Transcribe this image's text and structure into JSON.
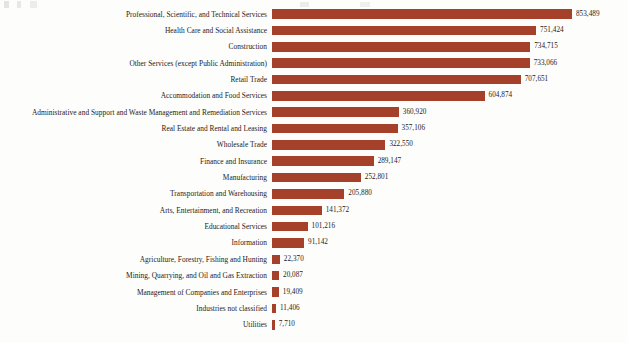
{
  "chart_data": {
    "type": "bar",
    "orientation": "horizontal",
    "title": "",
    "subtitle": "",
    "xlabel": "",
    "ylabel": "",
    "grid": false,
    "legend": null,
    "axis_visible": false,
    "xlim": [
      0,
      853489
    ],
    "bar_color": "#a5412b",
    "text_color": "#262220",
    "background": "#fdfdfc",
    "value_format": "comma-separated integer",
    "categories": [
      "Professional, Scientific, and Technical Services",
      "Health Care and Social Assistance",
      "Construction",
      "Other Services (except Public Administration)",
      "Retail Trade",
      "Accommodation and Food Services",
      "Administrative and Support and Waste Management and Remediation Services",
      "Real Estate and Rental and Leasing",
      "Wholesale Trade",
      "Finance and Insurance",
      "Manufacturing",
      "Transportation and Warehousing",
      "Arts, Entertainment, and Recreation",
      "Educational Services",
      "Information",
      "Agriculture, Forestry, Fishing and Hunting",
      "Mining, Quarrying, and Oil and Gas Extraction",
      "Management of Companies and Enterprises",
      "Industries not classified",
      "Utilities"
    ],
    "values": [
      853489,
      751424,
      734715,
      733066,
      707651,
      604874,
      360920,
      357106,
      322550,
      289147,
      252801,
      205880,
      141372,
      101216,
      91142,
      22370,
      20087,
      19409,
      11406,
      7710
    ],
    "value_labels": [
      "853,489",
      "751,424",
      "734,715",
      "733,066",
      "707,651",
      "604,874",
      "360,920",
      "357,106",
      "322,550",
      "289,147",
      "252,801",
      "205,880",
      "141,372",
      "101,216",
      "91,142",
      "22,370",
      "20,087",
      "19,409",
      "11,406",
      "7,710"
    ]
  }
}
